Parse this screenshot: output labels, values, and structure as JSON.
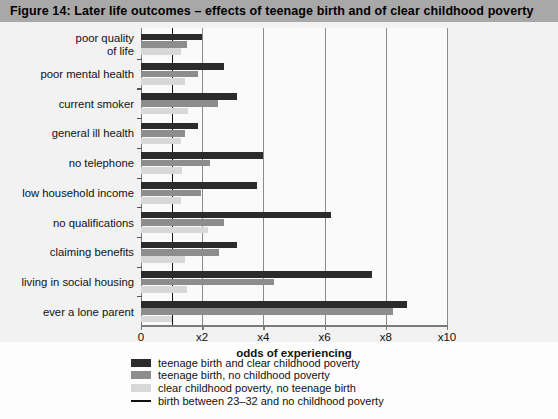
{
  "figure": {
    "title": "Figure 14:  Later life outcomes – effects of teenage birth and of clear childhood poverty",
    "header_bg": "#a8a8a8",
    "panel_bg": "#f2f2f2"
  },
  "legend": {
    "items": [
      {
        "label": "teenage birth and clear childhood poverty",
        "color": "#2b2b2b",
        "type": "swatch",
        "name": "legend-swatch-teen-birth-poverty"
      },
      {
        "label": "teenage birth, no childhood poverty",
        "color": "#8d8d8d",
        "type": "swatch",
        "name": "legend-swatch-teen-birth-no-poverty"
      },
      {
        "label": "clear childhood poverty, no teenage birth",
        "color": "#d8d8d8",
        "type": "swatch",
        "name": "legend-swatch-poverty-no-teen-birth"
      },
      {
        "label": "birth between 23–32 and no childhood poverty",
        "color": "#111111",
        "type": "line",
        "name": "legend-line-reference"
      }
    ]
  },
  "caption_cut": "",
  "chart_data": {
    "type": "bar",
    "orientation": "horizontal",
    "title": "Figure 14:  Later life outcomes – effects of teenage birth and of clear childhood poverty",
    "xlabel": "odds of experiencing",
    "ylabel": "",
    "xlim": [
      0,
      10
    ],
    "xticks": [
      0,
      2,
      4,
      6,
      8,
      10
    ],
    "xticklabels": [
      "0",
      "x2",
      "x4",
      "x6",
      "x8",
      "x10"
    ],
    "grid": "vertical",
    "legend_position": "below",
    "reference_line": {
      "value": 1,
      "label": "birth between 23–32 and no childhood poverty",
      "color": "#111111"
    },
    "categories": [
      "poor quality\nof life",
      "poor mental health",
      "current smoker",
      "general ill health",
      "no telephone",
      "low household income",
      "no qualifications",
      "claiming benefits",
      "living in social housing",
      "ever a lone parent"
    ],
    "series": [
      {
        "name": "teenage birth and clear childhood poverty",
        "color": "#2b2b2b",
        "values": [
          2.0,
          2.7,
          3.15,
          1.85,
          4.0,
          3.8,
          6.2,
          3.15,
          7.55,
          8.7
        ]
      },
      {
        "name": "teenage birth, no childhood poverty",
        "color": "#8d8d8d",
        "values": [
          1.5,
          1.85,
          2.5,
          1.45,
          2.25,
          1.95,
          2.7,
          2.55,
          4.35,
          8.25
        ]
      },
      {
        "name": "clear childhood poverty, no teenage birth",
        "color": "#d8d8d8",
        "values": [
          1.3,
          1.45,
          1.55,
          1.3,
          1.35,
          1.3,
          2.2,
          1.45,
          1.5,
          1.0
        ]
      }
    ]
  }
}
